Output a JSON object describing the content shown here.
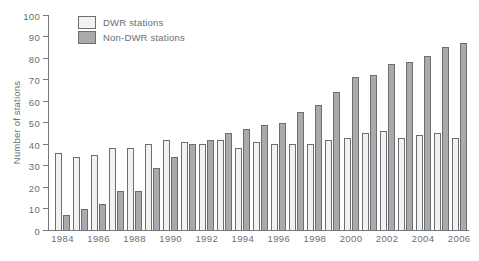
{
  "chart_data": {
    "type": "bar",
    "title": "",
    "xlabel": "",
    "ylabel": "Number of stations",
    "ylim": [
      0,
      100
    ],
    "yticks": [
      0,
      10,
      20,
      30,
      40,
      50,
      60,
      70,
      80,
      90,
      100
    ],
    "grid": false,
    "legend_position": "top-left",
    "categories": [
      "1984",
      "1985",
      "1986",
      "1987",
      "1988",
      "1989",
      "1990",
      "1991",
      "1992",
      "1993",
      "1994",
      "1995",
      "1996",
      "1997",
      "1998",
      "1999",
      "2000",
      "2001",
      "2002",
      "2003",
      "2004",
      "2005",
      "2006"
    ],
    "x_axis_labels_shown": [
      "1984",
      "1986",
      "1988",
      "1990",
      "1992",
      "1994",
      "1996",
      "1998",
      "2000",
      "2002",
      "2004",
      "2006"
    ],
    "series": [
      {
        "name": "DWR stations",
        "color": "#f2f2f0",
        "values": [
          36,
          34,
          35,
          38,
          38,
          40,
          42,
          41,
          40,
          42,
          38,
          41,
          40,
          40,
          40,
          42,
          43,
          45,
          46,
          43,
          44,
          45,
          43
        ]
      },
      {
        "name": "Non-DWR stations",
        "color": "#a8aaab",
        "values": [
          7,
          10,
          12,
          18,
          18,
          29,
          34,
          40,
          42,
          45,
          47,
          49,
          50,
          55,
          58,
          64,
          71,
          72,
          77,
          78,
          81,
          85,
          87
        ]
      }
    ]
  },
  "colors": {
    "axis": "#77787b",
    "bar_border": "#6d6e71",
    "text": "#6d6e71",
    "background": "#ffffff"
  }
}
